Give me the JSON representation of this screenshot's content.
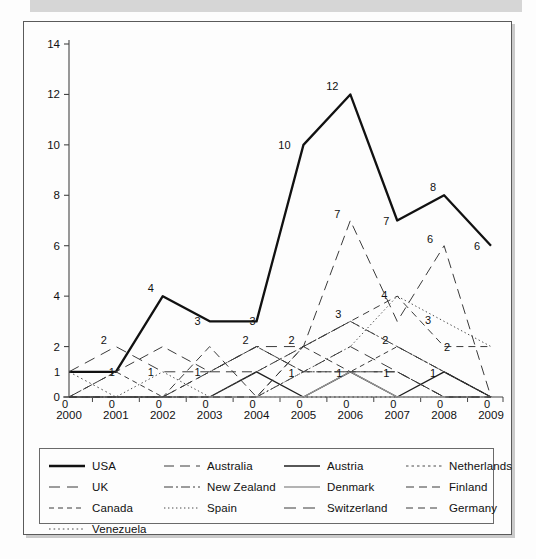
{
  "page": {
    "background_color": "#fdfdfd",
    "top_bar_color": "#d6d6d6",
    "frame_border_color": "#5a5a5a"
  },
  "chart_data": {
    "type": "line",
    "title": "",
    "subtitle": "",
    "xlabel": "",
    "ylabel": "",
    "x": [
      2000,
      2001,
      2002,
      2003,
      2004,
      2005,
      2006,
      2007,
      2008,
      2009
    ],
    "categories": [
      "2000",
      "2001",
      "2002",
      "2003",
      "2004",
      "2005",
      "2006",
      "2007",
      "2008",
      "2009"
    ],
    "xtick_labels": [
      "2000",
      "2001",
      "2002",
      "2003",
      "2004",
      "2005",
      "2006",
      "2007",
      "2008",
      "2009"
    ],
    "ytick_labels": [
      "0",
      "2",
      "4",
      "6",
      "8",
      "10",
      "12",
      "14"
    ],
    "yticks": [
      0,
      2,
      4,
      6,
      8,
      10,
      12,
      14
    ],
    "ylim": [
      0,
      14
    ],
    "xlim": [
      2000,
      2009
    ],
    "grid": false,
    "legend_position": "bottom",
    "legend_columns": 4,
    "data_labels_shown": true,
    "series": [
      {
        "name": "USA",
        "style": "solid-bold",
        "color": "#111111",
        "width": 2.3,
        "dash": "none",
        "values": [
          1,
          1,
          4,
          3,
          3,
          10,
          12,
          7,
          8,
          6
        ]
      },
      {
        "name": "UK",
        "style": "long-dash",
        "color": "#3b3b3b",
        "width": 1.0,
        "dash": "11,7",
        "values": [
          1,
          2,
          1,
          1,
          2,
          2,
          3,
          2,
          1,
          0
        ]
      },
      {
        "name": "Canada",
        "style": "dashed",
        "color": "#3b3b3b",
        "width": 1.0,
        "dash": "5,4",
        "values": [
          0,
          1,
          0,
          1,
          2,
          1,
          1,
          2,
          1,
          0
        ]
      },
      {
        "name": "Venezuela",
        "style": "dotted",
        "color": "#4a4a4a",
        "width": 1.0,
        "dash": "1.6,3",
        "values": [
          1,
          0,
          0,
          0,
          0,
          0,
          0,
          0,
          0,
          0
        ]
      },
      {
        "name": "Australia",
        "style": "long-dash",
        "color": "#3b3b3b",
        "width": 1.0,
        "dash": "10,6",
        "values": [
          0,
          1,
          2,
          1,
          1,
          2,
          7,
          3,
          6,
          0
        ]
      },
      {
        "name": "New Zealand",
        "style": "dash-dot",
        "color": "#3b3b3b",
        "width": 1.0,
        "dash": "9,3,2,3",
        "values": [
          0,
          0,
          0,
          0,
          0,
          1,
          1,
          1,
          0,
          0
        ]
      },
      {
        "name": "Spain",
        "style": "fine-dotted",
        "color": "#4a4a4a",
        "width": 1.0,
        "dash": "1.4,2.6",
        "values": [
          0,
          0,
          1,
          0,
          0,
          1,
          2,
          4,
          3,
          2
        ]
      },
      {
        "name": "Austria",
        "style": "solid",
        "color": "#1f1f1f",
        "width": 1.4,
        "dash": "none",
        "values": [
          0,
          0,
          0,
          0,
          1,
          0,
          1,
          0,
          1,
          0
        ]
      },
      {
        "name": "Denmark",
        "style": "solid-gray",
        "color": "#9a9a9a",
        "width": 1.3,
        "dash": "none",
        "values": [
          0,
          0,
          0,
          0,
          0,
          0,
          1,
          0,
          0,
          0
        ]
      },
      {
        "name": "Switzerland",
        "style": "long-dash",
        "color": "#3b3b3b",
        "width": 1.0,
        "dash": "12,7",
        "values": [
          0,
          0,
          0,
          1,
          2,
          1,
          2,
          1,
          0,
          0
        ]
      },
      {
        "name": "Netherlands",
        "style": "dotted",
        "color": "#4a4a4a",
        "width": 1.0,
        "dash": "2.5,3",
        "values": [
          0,
          0,
          0,
          0,
          1,
          2,
          3,
          2,
          1,
          0
        ]
      },
      {
        "name": "Finland",
        "style": "dashed-lg",
        "color": "#3b3b3b",
        "width": 1.0,
        "dash": "8,5",
        "values": [
          0,
          0,
          0,
          2,
          0,
          2,
          1,
          1,
          0,
          0
        ]
      },
      {
        "name": "Germany",
        "style": "dashed-lg",
        "color": "#3b3b3b",
        "width": 1.0,
        "dash": "7,5",
        "values": [
          0,
          0,
          0,
          0,
          0,
          2,
          3,
          4,
          2,
          2
        ]
      }
    ],
    "point_labels": [
      {
        "x": 2000,
        "y": 1,
        "text": "1",
        "dx": -12,
        "dy": 4
      },
      {
        "x": 2001,
        "y": 1,
        "text": "1",
        "dx": -4,
        "dy": 4
      },
      {
        "x": 2002,
        "y": 4,
        "text": "4",
        "dx": -12,
        "dy": -4
      },
      {
        "x": 2003,
        "y": 3,
        "text": "3",
        "dx": -12,
        "dy": 4
      },
      {
        "x": 2004,
        "y": 3,
        "text": "3",
        "dx": -4,
        "dy": 4
      },
      {
        "x": 2005,
        "y": 10,
        "text": "10",
        "dx": -19,
        "dy": 4
      },
      {
        "x": 2006,
        "y": 12,
        "text": "12",
        "dx": -18,
        "dy": -4
      },
      {
        "x": 2007,
        "y": 7,
        "text": "7",
        "dx": -11,
        "dy": 4
      },
      {
        "x": 2008,
        "y": 8,
        "text": "8",
        "dx": -11,
        "dy": -4
      },
      {
        "x": 2009,
        "y": 6,
        "text": "6",
        "dx": -14,
        "dy": 4
      },
      {
        "x": 2001,
        "y": 2,
        "text": "2",
        "dx": -12,
        "dy": -3
      },
      {
        "x": 2002,
        "y": 1,
        "text": "1",
        "dx": -12,
        "dy": 4
      },
      {
        "x": 2003,
        "y": 1,
        "text": "1",
        "dx": -12,
        "dy": 4
      },
      {
        "x": 2004,
        "y": 2,
        "text": "2",
        "dx": -11,
        "dy": -3
      },
      {
        "x": 2005,
        "y": 2,
        "text": "2",
        "dx": -12,
        "dy": -3
      },
      {
        "x": 2006,
        "y": 3,
        "text": "3",
        "dx": -12,
        "dy": -3
      },
      {
        "x": 2007,
        "y": 2,
        "text": "2",
        "dx": -12,
        "dy": -3
      },
      {
        "x": 2008,
        "y": 2,
        "text": "2",
        "dx": 3,
        "dy": 4
      },
      {
        "x": 2005,
        "y": 1,
        "text": "1",
        "dx": -12,
        "dy": 5
      },
      {
        "x": 2006,
        "y": 1,
        "text": "1",
        "dx": -11,
        "dy": 5
      },
      {
        "x": 2007,
        "y": 1,
        "text": "1",
        "dx": -11,
        "dy": 5
      },
      {
        "x": 2008,
        "y": 1,
        "text": "1",
        "dx": -11,
        "dy": 5
      },
      {
        "x": 2006,
        "y": 7,
        "text": "7",
        "dx": -13,
        "dy": -3
      },
      {
        "x": 2008,
        "y": 6,
        "text": "6",
        "dx": -14,
        "dy": -3
      },
      {
        "x": 2007,
        "y": 4,
        "text": "4",
        "dx": -13,
        "dy": 3
      },
      {
        "x": 2008,
        "y": 3,
        "text": "3",
        "dx": -16,
        "dy": 3
      },
      {
        "x": 2000,
        "y": 0,
        "text": "0",
        "dx": -4,
        "dy": 11
      },
      {
        "x": 2001,
        "y": 0,
        "text": "0",
        "dx": -4,
        "dy": 11
      },
      {
        "x": 2002,
        "y": 0,
        "text": "0",
        "dx": -4,
        "dy": 11
      },
      {
        "x": 2003,
        "y": 0,
        "text": "0",
        "dx": -4,
        "dy": 11
      },
      {
        "x": 2004,
        "y": 0,
        "text": "0",
        "dx": -4,
        "dy": 11
      },
      {
        "x": 2005,
        "y": 0,
        "text": "0",
        "dx": -4,
        "dy": 11
      },
      {
        "x": 2006,
        "y": 0,
        "text": "0",
        "dx": -4,
        "dy": 11
      },
      {
        "x": 2007,
        "y": 0,
        "text": "0",
        "dx": -4,
        "dy": 11
      },
      {
        "x": 2008,
        "y": 0,
        "text": "0",
        "dx": -4,
        "dy": 11
      },
      {
        "x": 2009,
        "y": 0,
        "text": "0",
        "dx": -4,
        "dy": 11
      }
    ]
  },
  "legend": {
    "order": [
      "USA",
      "Australia",
      "Austria",
      "Netherlands",
      "UK",
      "New Zealand",
      "Denmark",
      "Finland",
      "Canada",
      "Spain",
      "Switzerland",
      "Germany",
      "Venezuela"
    ]
  }
}
